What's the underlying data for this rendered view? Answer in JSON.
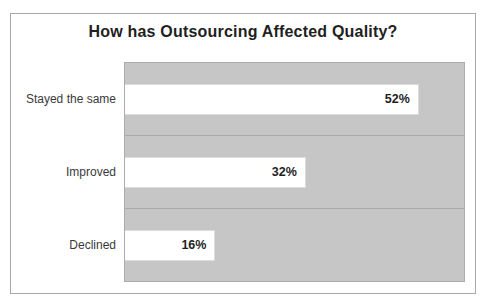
{
  "chart_data": {
    "type": "bar",
    "orientation": "horizontal",
    "title": "How has Outsourcing Affected Quality?",
    "categories": [
      "Stayed the same",
      "Improved",
      "Declined"
    ],
    "values": [
      52,
      32,
      16
    ],
    "value_labels": [
      "52%",
      "32%",
      "16%"
    ],
    "xlabel": "",
    "ylabel": "",
    "xlim": [
      0,
      60
    ],
    "axis_tick_labels_visible": false,
    "legend": "none",
    "grid": "horizontal category separators",
    "colors": {
      "bar_fill": "#ffffff",
      "plot_background": "#c6c6c6",
      "gridline": "#a9a9a9",
      "chart_border": "#a8a8a8",
      "title_text": "#1f1f1f",
      "category_label_text": "#3a3a3a",
      "value_label_text": "#1f1f1f"
    }
  }
}
